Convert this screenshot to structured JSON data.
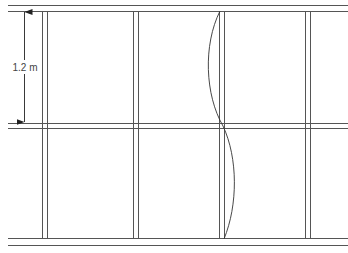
{
  "diagram": {
    "horizontal_members": [
      {
        "name": "top-plate"
      },
      {
        "name": "mid-noggin"
      },
      {
        "name": "bottom-plate"
      }
    ],
    "studs": [
      {
        "name": "stud-1"
      },
      {
        "name": "stud-2"
      },
      {
        "name": "stud-3"
      },
      {
        "name": "stud-4"
      }
    ],
    "buckled_stud_index": 2,
    "dimension": {
      "label": "1.2 m",
      "spans": "top-plate to mid-noggin"
    },
    "colors": {
      "lines": "#555555",
      "curve": "#333333",
      "text": "#444444",
      "background": "#ffffff"
    }
  }
}
